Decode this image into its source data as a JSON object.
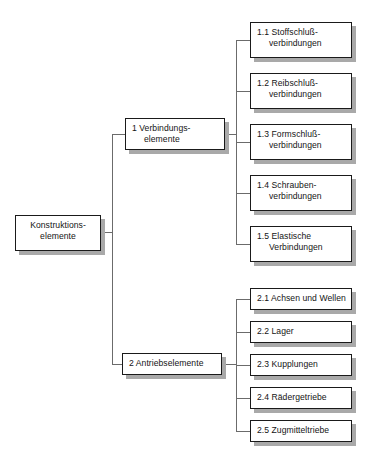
{
  "diagram": {
    "type": "tree-hierarchy",
    "language": "de",
    "colors": {
      "background": "#ffffff",
      "box_fill": "#ffffff",
      "box_border": "#1a1a1a",
      "shadow": "#a9a9a9",
      "connector": "#6b6b6b",
      "text": "#141414"
    },
    "root": {
      "line1": "Konstruktions-",
      "line2": "elemente"
    },
    "branches": [
      {
        "line1": "1 Verbindungs-",
        "line2": "elemente",
        "children": [
          {
            "line1": "1.1 Stoffschluß-",
            "line2": "verbindungen"
          },
          {
            "line1": "1.2 Reibschluß-",
            "line2": "verbindungen"
          },
          {
            "line1": "1.3 Formschluß-",
            "line2": "verbindungen"
          },
          {
            "line1": "1.4 Schrauben-",
            "line2": "verbindungen"
          },
          {
            "line1": "1.5 Elastische",
            "line2": "Verbindungen"
          }
        ]
      },
      {
        "line1": "2 Antriebselemente",
        "line2": "",
        "children": [
          {
            "line1": "2.1 Achsen und Wellen",
            "line2": ""
          },
          {
            "line1": "2.2 Lager",
            "line2": ""
          },
          {
            "line1": "2.3 Kupplungen",
            "line2": ""
          },
          {
            "line1": "2.4 Rädergetriebe",
            "line2": ""
          },
          {
            "line1": "2.5 Zugmitteltriebe",
            "line2": ""
          }
        ]
      }
    ]
  }
}
